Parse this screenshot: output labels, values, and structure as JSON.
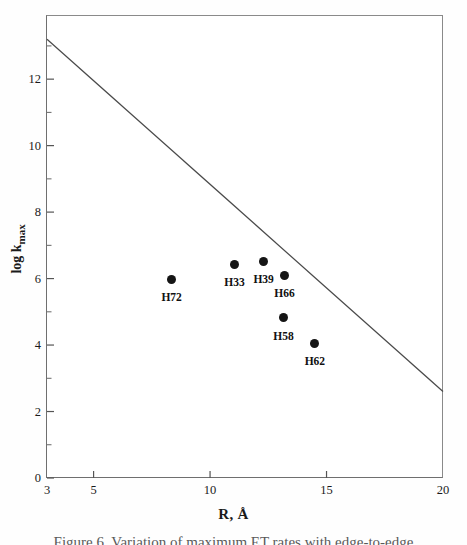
{
  "figure": {
    "background_color": "#ffffff",
    "frame_color": "#6f6f6f",
    "marker_color": "#151515",
    "line_color": "#4a4a4a"
  },
  "caption_partial": "Figure 6. Variation of maximum ET rates with edge-to-edge",
  "chart_data": {
    "type": "scatter",
    "title": "",
    "xlabel": "R, Å",
    "ylabel_main": "log k",
    "ylabel_sub": "max",
    "ylabel": "log k max",
    "xlim": [
      3,
      20
    ],
    "ylim": [
      0,
      13.9
    ],
    "grid": false,
    "legend": "none",
    "xticks_major": [
      3,
      5,
      10,
      15,
      20
    ],
    "xticks_major_labels": [
      "3",
      "5",
      "10",
      "15",
      "20"
    ],
    "yticks_major": [
      0,
      2,
      4,
      6,
      8,
      10,
      12
    ],
    "yticks_major_labels": [
      "0",
      "2",
      "4",
      "6",
      "8",
      "10",
      "12"
    ],
    "yticks_minor": [
      1,
      3,
      5,
      7,
      9,
      11,
      13
    ],
    "points": [
      {
        "label": "H72",
        "x": 8.35,
        "y": 5.98,
        "label_dx": 0,
        "label_dy": 13
      },
      {
        "label": "H33",
        "x": 11.05,
        "y": 6.43,
        "label_dx": 0,
        "label_dy": 13
      },
      {
        "label": "H39",
        "x": 12.3,
        "y": 6.52,
        "label_dx": 0,
        "label_dy": 13
      },
      {
        "label": "H66",
        "x": 13.2,
        "y": 6.1,
        "label_dx": 0,
        "label_dy": 13
      },
      {
        "label": "H58",
        "x": 13.15,
        "y": 4.82,
        "label_dx": 0,
        "label_dy": 13
      },
      {
        "label": "H62",
        "x": 14.5,
        "y": 4.06,
        "label_dx": 0,
        "label_dy": 13
      }
    ],
    "reference_line": {
      "name": "maximum-rate-line",
      "x": [
        3,
        20
      ],
      "y": [
        13.2,
        2.6
      ]
    }
  }
}
